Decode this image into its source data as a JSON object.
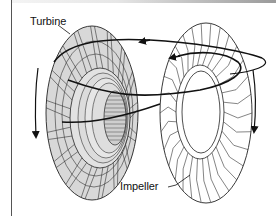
{
  "figure": {
    "labels": {
      "turbine": "Turbine",
      "impeller": "Impeller"
    },
    "components": [
      {
        "name": "turbine",
        "shading": "grey",
        "fill_color": "#d8d8d8"
      },
      {
        "name": "impeller",
        "shading": "white",
        "fill_color": "#ffffff"
      }
    ],
    "arrows": [
      {
        "name": "turbine-rotation-arrow",
        "direction": "down"
      },
      {
        "name": "impeller-rotation-arrow",
        "direction": "down"
      },
      {
        "name": "fluid-flow-arrow-outer",
        "direction": "toward turbine"
      },
      {
        "name": "fluid-flow-arrow-inner",
        "direction": "toward turbine"
      }
    ],
    "colors": {
      "line": "#111111",
      "turbine_fill": "#d8d8d8",
      "hub_fill": "#e4e4e4"
    }
  }
}
